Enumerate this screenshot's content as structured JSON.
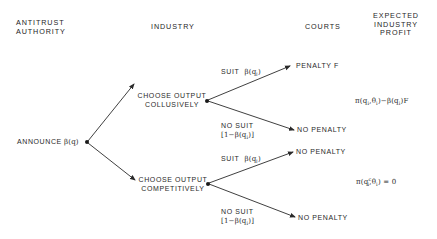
{
  "headers": {
    "authority": [
      "ANTITRUST",
      "AUTHORITY"
    ],
    "industry": "INDUSTRY",
    "courts": "COURTS",
    "profit": [
      "EXPECTED",
      "INDUSTRY",
      "PROFIT"
    ]
  },
  "root": {
    "label": "ANNOUNCE",
    "policy": "β(q)"
  },
  "branches": {
    "collusive": {
      "label_line1": "CHOOSE OUTPUT",
      "label_line2": "COLLUSIVELY",
      "suit_label": "SUIT",
      "suit_prob": "β(q",
      "suit_prob_sub": "i",
      "suit_prob_close": ")",
      "no_suit_label": "NO SUIT",
      "no_suit_prob": "[1−β(q",
      "no_suit_prob_sub": "i",
      "no_suit_prob_close": ")]",
      "outcome_suit": "PENALTY  F",
      "outcome_no_suit": "NO  PENALTY",
      "expected_profit": "π(q_i, θ_i) − β(q_i) F"
    },
    "competitive": {
      "label_line1": "CHOOSE OUTPUT",
      "label_line2": "COMPETITIVELY",
      "suit_label": "SUIT",
      "suit_prob": "β(q",
      "suit_prob_sub": "i",
      "suit_prob_close": ")",
      "no_suit_label": "NO SUIT",
      "no_suit_prob": "[1−β(q",
      "no_suit_prob_sub": "i",
      "no_suit_prob_close": ")]",
      "outcome_suit": "NO  PENALTY",
      "outcome_no_suit": "NO  PENALTY",
      "expected_profit": "π(q_i^c, θ_i) = 0"
    }
  },
  "profit_formulas": {
    "collusive": {
      "pi": "π(q",
      "sub1": "i",
      "comma": ",θ",
      "sub2": "i",
      "mid": ")−β(q",
      "sub3": "i",
      "end": ")F"
    },
    "competitive": {
      "pi": "π(q",
      "sup1": "c",
      "sub1": "i",
      "comma": ",θ",
      "sub2": "i",
      "end": ") = 0"
    }
  },
  "colors": {
    "line": "#2a2a2a",
    "text": "#2a2a2a",
    "background": "#ffffff"
  }
}
